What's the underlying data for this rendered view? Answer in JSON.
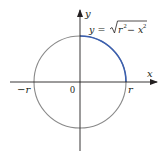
{
  "diagram": {
    "axes": {
      "x_label": "x",
      "y_label": "y",
      "origin_label": "0",
      "neg_r_label": "−r",
      "pos_r_label": "r"
    },
    "equation": {
      "lhs": "y = ",
      "radical_content": "r",
      "sup1": "2",
      "minus": " − x",
      "sup2": "2"
    },
    "colors": {
      "circle": "#8a8a8a",
      "highlight_arc": "#3a5fb0",
      "axes": "#231f20",
      "text": "#231f20"
    }
  }
}
